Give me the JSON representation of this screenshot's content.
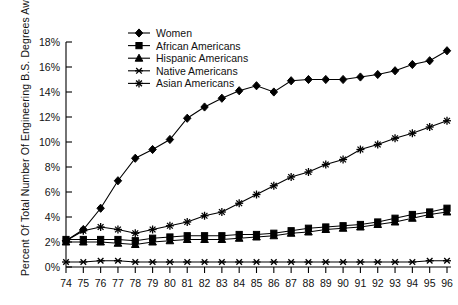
{
  "chart_data": {
    "type": "line",
    "title": "",
    "xlabel": "",
    "ylabel": "Percent Of Total Number Of Engineering B.S. Degrees Awarded",
    "ylim": [
      0,
      18
    ],
    "ytick_labels": [
      "0%",
      "2%",
      "4%",
      "6%",
      "8%",
      "10%",
      "12%",
      "14%",
      "16%",
      "18%"
    ],
    "ytick_values": [
      0,
      2,
      4,
      6,
      8,
      10,
      12,
      14,
      16,
      18
    ],
    "grid": false,
    "legend_position": "top-center",
    "categories": [
      "74",
      "75",
      "76",
      "77",
      "78",
      "79",
      "80",
      "81",
      "82",
      "83",
      "84",
      "85",
      "86",
      "87",
      "88",
      "89",
      "90",
      "91",
      "92",
      "93",
      "94",
      "95",
      "96"
    ],
    "x": [
      74,
      75,
      76,
      77,
      78,
      79,
      80,
      81,
      82,
      83,
      84,
      85,
      86,
      87,
      88,
      89,
      90,
      91,
      92,
      93,
      94,
      95,
      96
    ],
    "series": [
      {
        "name": "Women",
        "marker": "diamond",
        "values": [
          2.1,
          3.0,
          4.7,
          6.9,
          8.7,
          9.4,
          10.2,
          11.9,
          12.8,
          13.5,
          14.1,
          14.5,
          14.0,
          14.9,
          15.0,
          15.0,
          15.0,
          15.2,
          15.4,
          15.7,
          16.2,
          16.5,
          17.3
        ]
      },
      {
        "name": "African Americans",
        "marker": "square",
        "values": [
          2.2,
          2.2,
          2.2,
          2.2,
          2.1,
          2.3,
          2.4,
          2.5,
          2.5,
          2.5,
          2.6,
          2.6,
          2.7,
          2.9,
          3.1,
          3.2,
          3.3,
          3.4,
          3.6,
          3.9,
          4.2,
          4.4,
          4.7
        ]
      },
      {
        "name": "Hispanic Americans",
        "marker": "triangle",
        "values": [
          2.0,
          2.0,
          2.0,
          1.9,
          1.8,
          2.0,
          2.1,
          2.2,
          2.2,
          2.2,
          2.3,
          2.4,
          2.5,
          2.7,
          2.8,
          3.0,
          3.1,
          3.2,
          3.4,
          3.6,
          3.9,
          4.2,
          4.4
        ]
      },
      {
        "name": "Native Americans",
        "marker": "x-dash",
        "values": [
          0.4,
          0.4,
          0.5,
          0.5,
          0.4,
          0.4,
          0.4,
          0.4,
          0.4,
          0.4,
          0.4,
          0.4,
          0.4,
          0.4,
          0.4,
          0.4,
          0.4,
          0.4,
          0.4,
          0.4,
          0.4,
          0.5,
          0.5
        ]
      },
      {
        "name": "Asian Americans",
        "marker": "star",
        "values": [
          2.1,
          2.9,
          3.2,
          3.0,
          2.7,
          3.0,
          3.3,
          3.6,
          4.1,
          4.4,
          5.1,
          5.8,
          6.5,
          7.2,
          7.6,
          8.2,
          8.6,
          9.4,
          9.8,
          10.3,
          10.7,
          11.2,
          11.7
        ]
      }
    ]
  },
  "legend": {
    "items": [
      {
        "label": "Women"
      },
      {
        "label": "African Americans"
      },
      {
        "label": "Hispanic Americans"
      },
      {
        "label": "Native Americans"
      },
      {
        "label": "Asian Americans"
      }
    ]
  }
}
